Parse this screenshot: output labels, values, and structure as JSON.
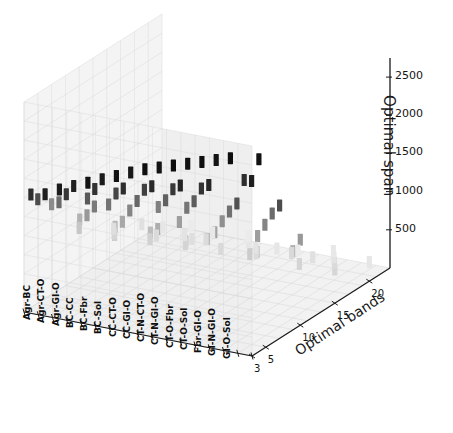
{
  "figure": {
    "kind": "3d-scatter-plot",
    "background": "#ffffff",
    "pane_color": "#f2f2f2",
    "grid_color": "#d8d8d8",
    "axis_color": "#1a1a1a",
    "marker_shape": "vertical-rectangle"
  },
  "chart_data": {
    "type": "scatter",
    "projection": "3d",
    "title": "",
    "xlabel": "",
    "ylabel": "Optimal bands",
    "zlabel": "Optimal span",
    "grid": true,
    "legend": null,
    "xtick_labels": [
      "Agr-BC",
      "Agr-CT-O",
      "Agr-GI-O",
      "BC-CC",
      "BC-Fbr",
      "BC-Sol",
      "CC-CT-O",
      "CC-GI-O",
      "CT-N-CT-O",
      "CT-N-GI-O",
      "CT-O-Fbr",
      "CT-O-Sol",
      "Fbr-GI-O",
      "GI-N-GI-O",
      "GI-O-Sol"
    ],
    "xtick_count": 17,
    "ytick_labels": [
      "3",
      "5",
      "10",
      "15",
      "20"
    ],
    "ytick_values": [
      3,
      5,
      10,
      15,
      20
    ],
    "ylim": [
      3,
      23
    ],
    "ztick_labels": [
      "500",
      "1000",
      "1500",
      "2000",
      "2500"
    ],
    "ztick_values": [
      500,
      1000,
      1500,
      2000,
      2500
    ],
    "zlim": [
      0,
      2750
    ],
    "points": [
      {
        "x": 0,
        "y": 4,
        "z": 1480,
        "shade": 0.18
      },
      {
        "x": 0,
        "y": 5,
        "z": 1360,
        "shade": 0.3
      },
      {
        "x": 0,
        "y": 7,
        "z": 1180,
        "shade": 0.55
      },
      {
        "x": 0,
        "y": 11,
        "z": 640,
        "shade": 0.78
      },
      {
        "x": 1,
        "y": 4,
        "z": 1520,
        "shade": 0.12
      },
      {
        "x": 1,
        "y": 6,
        "z": 1300,
        "shade": 0.42
      },
      {
        "x": 1,
        "y": 9,
        "z": 900,
        "shade": 0.7
      },
      {
        "x": 1,
        "y": 14,
        "z": 430,
        "shade": 0.84
      },
      {
        "x": 2,
        "y": 4,
        "z": 1620,
        "shade": 0.1
      },
      {
        "x": 2,
        "y": 5,
        "z": 1500,
        "shade": 0.22
      },
      {
        "x": 2,
        "y": 8,
        "z": 1050,
        "shade": 0.6
      },
      {
        "x": 2,
        "y": 12,
        "z": 560,
        "shade": 0.8
      },
      {
        "x": 3,
        "y": 4,
        "z": 1700,
        "shade": 0.12
      },
      {
        "x": 3,
        "y": 6,
        "z": 1420,
        "shade": 0.35
      },
      {
        "x": 3,
        "y": 7,
        "z": 1260,
        "shade": 0.48
      },
      {
        "x": 3,
        "y": 10,
        "z": 820,
        "shade": 0.72
      },
      {
        "x": 3,
        "y": 16,
        "z": 360,
        "shade": 0.86
      },
      {
        "x": 4,
        "y": 4,
        "z": 1780,
        "shade": 0.08
      },
      {
        "x": 4,
        "y": 5,
        "z": 1640,
        "shade": 0.2
      },
      {
        "x": 4,
        "y": 7,
        "z": 1320,
        "shade": 0.45
      },
      {
        "x": 4,
        "y": 9,
        "z": 980,
        "shade": 0.66
      },
      {
        "x": 4,
        "y": 13,
        "z": 520,
        "shade": 0.82
      },
      {
        "x": 5,
        "y": 4,
        "z": 1860,
        "shade": 0.1
      },
      {
        "x": 5,
        "y": 6,
        "z": 1560,
        "shade": 0.28
      },
      {
        "x": 5,
        "y": 8,
        "z": 1220,
        "shade": 0.52
      },
      {
        "x": 5,
        "y": 11,
        "z": 760,
        "shade": 0.74
      },
      {
        "x": 5,
        "y": 17,
        "z": 330,
        "shade": 0.87
      },
      {
        "x": 6,
        "y": 4,
        "z": 1940,
        "shade": 0.07
      },
      {
        "x": 6,
        "y": 5,
        "z": 1720,
        "shade": 0.18
      },
      {
        "x": 6,
        "y": 7,
        "z": 1440,
        "shade": 0.4
      },
      {
        "x": 6,
        "y": 10,
        "z": 900,
        "shade": 0.68
      },
      {
        "x": 6,
        "y": 14,
        "z": 470,
        "shade": 0.83
      },
      {
        "x": 7,
        "y": 4,
        "z": 2020,
        "shade": 0.09
      },
      {
        "x": 7,
        "y": 6,
        "z": 1680,
        "shade": 0.25
      },
      {
        "x": 7,
        "y": 8,
        "z": 1340,
        "shade": 0.5
      },
      {
        "x": 7,
        "y": 12,
        "z": 660,
        "shade": 0.78
      },
      {
        "x": 8,
        "y": 4,
        "z": 2100,
        "shade": 0.06
      },
      {
        "x": 8,
        "y": 5,
        "z": 1820,
        "shade": 0.16
      },
      {
        "x": 8,
        "y": 7,
        "z": 1520,
        "shade": 0.38
      },
      {
        "x": 8,
        "y": 9,
        "z": 1120,
        "shade": 0.62
      },
      {
        "x": 8,
        "y": 15,
        "z": 420,
        "shade": 0.85
      },
      {
        "x": 9,
        "y": 4,
        "z": 2160,
        "shade": 0.08
      },
      {
        "x": 9,
        "y": 6,
        "z": 1760,
        "shade": 0.22
      },
      {
        "x": 9,
        "y": 8,
        "z": 1400,
        "shade": 0.46
      },
      {
        "x": 9,
        "y": 11,
        "z": 820,
        "shade": 0.72
      },
      {
        "x": 10,
        "y": 4,
        "z": 2220,
        "shade": 0.05
      },
      {
        "x": 10,
        "y": 5,
        "z": 1900,
        "shade": 0.14
      },
      {
        "x": 10,
        "y": 7,
        "z": 1580,
        "shade": 0.36
      },
      {
        "x": 10,
        "y": 10,
        "z": 1000,
        "shade": 0.64
      },
      {
        "x": 10,
        "y": 16,
        "z": 380,
        "shade": 0.86
      },
      {
        "x": 11,
        "y": 4,
        "z": 2280,
        "shade": 0.07
      },
      {
        "x": 11,
        "y": 6,
        "z": 1840,
        "shade": 0.2
      },
      {
        "x": 11,
        "y": 9,
        "z": 1240,
        "shade": 0.56
      },
      {
        "x": 11,
        "y": 13,
        "z": 580,
        "shade": 0.8
      },
      {
        "x": 12,
        "y": 4,
        "z": 2340,
        "shade": 0.06
      },
      {
        "x": 12,
        "y": 5,
        "z": 1980,
        "shade": 0.15
      },
      {
        "x": 12,
        "y": 8,
        "z": 1460,
        "shade": 0.44
      },
      {
        "x": 12,
        "y": 12,
        "z": 700,
        "shade": 0.76
      },
      {
        "x": 13,
        "y": 4,
        "z": 2400,
        "shade": 0.08
      },
      {
        "x": 13,
        "y": 7,
        "z": 1660,
        "shade": 0.32
      },
      {
        "x": 13,
        "y": 10,
        "z": 1060,
        "shade": 0.62
      },
      {
        "x": 13,
        "y": 18,
        "z": 320,
        "shade": 0.88
      },
      {
        "x": 14,
        "y": 4,
        "z": 2460,
        "shade": 0.05
      },
      {
        "x": 14,
        "y": 6,
        "z": 2060,
        "shade": 0.18
      },
      {
        "x": 14,
        "y": 9,
        "z": 1300,
        "shade": 0.52
      },
      {
        "x": 14,
        "y": 14,
        "z": 500,
        "shade": 0.83
      },
      {
        "x": 15,
        "y": 5,
        "z": 2140,
        "shade": 0.12
      },
      {
        "x": 15,
        "y": 8,
        "z": 1540,
        "shade": 0.42
      },
      {
        "x": 15,
        "y": 11,
        "z": 880,
        "shade": 0.7
      },
      {
        "x": 16,
        "y": 4,
        "z": 2520,
        "shade": 0.07
      },
      {
        "x": 16,
        "y": 7,
        "z": 1740,
        "shade": 0.3
      },
      {
        "x": 16,
        "y": 10,
        "z": 1120,
        "shade": 0.6
      },
      {
        "x": 16,
        "y": 15,
        "z": 440,
        "shade": 0.84
      },
      {
        "x": 2,
        "y": 19,
        "z": 260,
        "shade": 0.9
      },
      {
        "x": 5,
        "y": 20,
        "z": 240,
        "shade": 0.91
      },
      {
        "x": 8,
        "y": 19,
        "z": 280,
        "shade": 0.9
      },
      {
        "x": 11,
        "y": 20,
        "z": 220,
        "shade": 0.92
      },
      {
        "x": 14,
        "y": 19,
        "z": 300,
        "shade": 0.89
      },
      {
        "x": 0,
        "y": 16,
        "z": 340,
        "shade": 0.87
      },
      {
        "x": 6,
        "y": 17,
        "z": 360,
        "shade": 0.86
      },
      {
        "x": 12,
        "y": 17,
        "z": 400,
        "shade": 0.85
      },
      {
        "x": 9,
        "y": 18,
        "z": 300,
        "shade": 0.89
      },
      {
        "x": 3,
        "y": 21,
        "z": 200,
        "shade": 0.92
      },
      {
        "x": 7,
        "y": 21,
        "z": 210,
        "shade": 0.92
      },
      {
        "x": 13,
        "y": 21,
        "z": 230,
        "shade": 0.91
      },
      {
        "x": 16,
        "y": 20,
        "z": 250,
        "shade": 0.9
      },
      {
        "x": 1,
        "y": 18,
        "z": 320,
        "shade": 0.88
      },
      {
        "x": 4,
        "y": 18,
        "z": 290,
        "shade": 0.89
      },
      {
        "x": 10,
        "y": 19,
        "z": 270,
        "shade": 0.9
      },
      {
        "x": 15,
        "y": 17,
        "z": 380,
        "shade": 0.86
      }
    ]
  }
}
